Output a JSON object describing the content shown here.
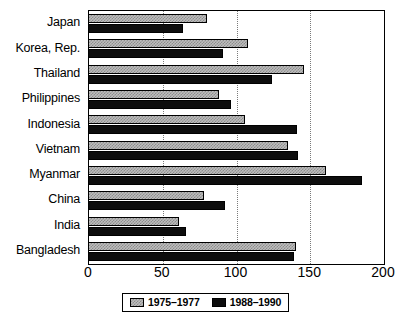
{
  "chart_data": {
    "type": "bar",
    "orientation": "horizontal",
    "title": "",
    "subtitle": "",
    "xlabel": "",
    "ylabel": "",
    "xlim": [
      0,
      200
    ],
    "xticks": [
      0,
      50,
      100,
      150,
      200
    ],
    "xtick_labels": [
      "0",
      "50",
      "100",
      "150",
      "200"
    ],
    "grid": "vertical-dotted",
    "legend_position": "bottom-center",
    "categories": [
      "Japan",
      "Korea, Rep.",
      "Thailand",
      "Philippines",
      "Indonesia",
      "Vietnam",
      "Myanmar",
      "China",
      "India",
      "Bangladesh"
    ],
    "series": [
      {
        "name": "1975–1977",
        "color": "#bdbdbd",
        "pattern": "checkered-gray",
        "values": [
          80,
          108,
          146,
          88,
          106,
          135,
          161,
          78,
          61,
          140
        ]
      },
      {
        "name": "1988–1990",
        "color": "#0d0d0d",
        "pattern": "solid-black",
        "values": [
          64,
          91,
          124,
          96,
          141,
          142,
          185,
          92,
          66,
          139
        ]
      }
    ]
  },
  "legend": {
    "items": [
      {
        "label": "1975–1977"
      },
      {
        "label": "1988–1990"
      }
    ]
  },
  "colors": {
    "axis": "#000000",
    "grid": "#7a7a7a",
    "background": "#ffffff",
    "series_a": "#bdbdbd",
    "series_b": "#0d0d0d"
  }
}
